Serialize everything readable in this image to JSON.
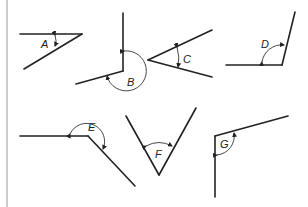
{
  "diagram": {
    "angles": [
      {
        "id": "A",
        "label": "A",
        "type": "acute"
      },
      {
        "id": "B",
        "label": "B",
        "type": "reflex"
      },
      {
        "id": "C",
        "label": "C",
        "type": "acute"
      },
      {
        "id": "D",
        "label": "D",
        "type": "obtuse"
      },
      {
        "id": "E",
        "label": "E",
        "type": "reflex"
      },
      {
        "id": "F",
        "label": "F",
        "type": "acute"
      },
      {
        "id": "G",
        "label": "G",
        "type": "acute"
      }
    ],
    "colors": {
      "line": "#222222",
      "border": "#aaaaaa",
      "background": "#ffffff"
    }
  }
}
